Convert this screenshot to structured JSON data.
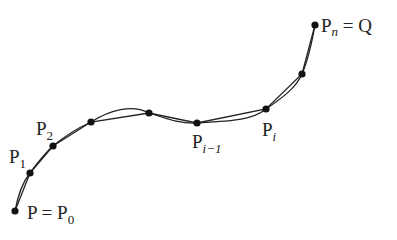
{
  "diagram": {
    "colors": {
      "curve": "#222222",
      "point": "#111111",
      "text": "#222222",
      "background": "#ffffff"
    },
    "points": [
      {
        "id": "P0",
        "x": 15,
        "y": 211
      },
      {
        "id": "P1",
        "x": 30,
        "y": 173
      },
      {
        "id": "P2",
        "x": 53,
        "y": 146
      },
      {
        "id": "P3",
        "x": 91,
        "y": 122
      },
      {
        "id": "P4",
        "x": 149,
        "y": 113
      },
      {
        "id": "Pi-1",
        "x": 197,
        "y": 123
      },
      {
        "id": "Pi",
        "x": 266,
        "y": 109
      },
      {
        "id": "P7",
        "x": 302,
        "y": 74
      },
      {
        "id": "Pn",
        "x": 315,
        "y": 25
      }
    ],
    "labels": {
      "p0": {
        "main": "P = P",
        "sub": "0"
      },
      "p1": {
        "main": "P",
        "sub": "1"
      },
      "p2": {
        "main": "P",
        "sub": "2"
      },
      "pi_minus_1": {
        "main": "P",
        "sub": "i−1"
      },
      "pi": {
        "main": "P",
        "sub": "i"
      },
      "pn": {
        "main": "P",
        "sub": "n",
        "suffix": " = Q"
      }
    }
  }
}
